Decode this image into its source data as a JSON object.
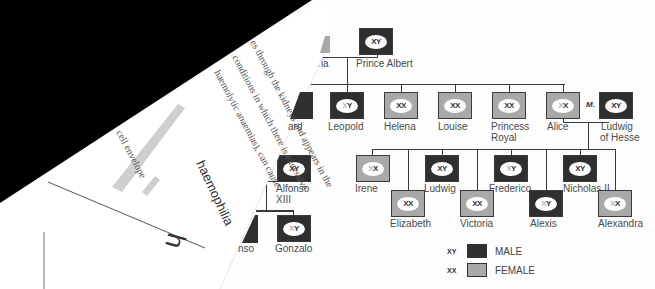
{
  "title": "haemophilia",
  "page_letter": "h",
  "text_lines": [
    "es through the kidneys and appears in the",
    "conditions in which there is excessive",
    "haemolytic anaemias), can cause",
    "cell envelope"
  ],
  "tree": {
    "generation1": [
      {
        "name": "Victoria",
        "visible": "oria",
        "sex": "female"
      },
      {
        "name": "Prince Albert",
        "sex": "male",
        "genes": "XY"
      }
    ],
    "generation2": [
      {
        "name": "Edward",
        "visible": "ard",
        "sex": "male"
      },
      {
        "name": "Leopold",
        "sex": "male",
        "genes": "XY",
        "carrier_affected": true
      },
      {
        "name": "Helena",
        "sex": "female",
        "genes": "XX"
      },
      {
        "name": "Louise",
        "sex": "female",
        "genes": "XX"
      },
      {
        "name": "Princess Royal",
        "line1": "Princess",
        "line2": "Royal",
        "sex": "female",
        "genes": "XX"
      },
      {
        "name": "Alice",
        "sex": "female",
        "genes": "XX",
        "carrier": true
      },
      {
        "name": "Ludwig of Hesse",
        "line1": "Ludwig",
        "line2": "of Hesse",
        "sex": "male",
        "genes": "XY"
      }
    ],
    "marriage_label": "M.",
    "generation3": [
      {
        "name": "Irene",
        "sex": "female",
        "genes": "XX",
        "carrier": true
      },
      {
        "name": "Elizabeth",
        "sex": "female",
        "genes": "XX"
      },
      {
        "name": "Ludwig",
        "sex": "male",
        "genes": "XY"
      },
      {
        "name": "Victoria",
        "sex": "female",
        "genes": "XX"
      },
      {
        "name": "Frederico",
        "sex": "male",
        "genes": "XY",
        "carrier_affected": true
      },
      {
        "name": "Alexis",
        "sex": "male",
        "genes": "XY",
        "carrier_affected": true
      },
      {
        "name": "Nicholas II",
        "sex": "male",
        "genes": "XY"
      },
      {
        "name": "Alexandra",
        "sex": "female",
        "genes": "XX",
        "carrier": true
      }
    ],
    "spanish_branch": [
      {
        "name": "Alfonso XIII",
        "line1": "Alfonso",
        "line2": "XIII",
        "sex": "male",
        "genes": "XY"
      },
      {
        "name": "Alfonso",
        "visible": "nso",
        "sex": "male"
      },
      {
        "name": "Gonzalo",
        "sex": "male",
        "genes": "XY",
        "carrier_affected": true
      }
    ]
  },
  "legend": [
    {
      "symbol": "XY",
      "label": "MALE",
      "color": "#2f2f2f"
    },
    {
      "symbol": "XX",
      "label": "FEMALE",
      "color": "#a9a9a9"
    }
  ],
  "colors": {
    "male": "#2f2f2f",
    "female": "#a9a9a9",
    "fold": "#000000"
  }
}
